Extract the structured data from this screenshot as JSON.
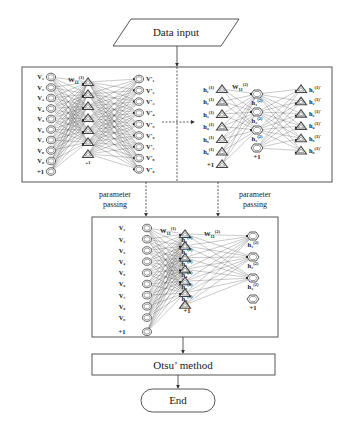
{
  "flowchart": {
    "start": {
      "label": "Data input",
      "shape": "parallelogram"
    },
    "pretrain_panel": {
      "rbm1": {
        "visible_labels": [
          "V₁",
          "V₂",
          "V₃",
          "V₄",
          "V₅",
          "V₆",
          "V₇",
          "V₈",
          "V₉",
          "+1"
        ],
        "weight_label": "W",
        "weight_sub": "11",
        "weight_sup": "(1)",
        "hidden_count": 7,
        "hidden_bias": "+1",
        "recon_labels": [
          "V'₁",
          "V'₂",
          "V'₃",
          "V'₄",
          "V'₅",
          "V'₆",
          "V'₇",
          "V'₈",
          "V'₉"
        ]
      },
      "rbm2": {
        "input_labels": [
          "h₁",
          "h₂",
          "h₃",
          "h₄",
          "h₅",
          "h₆",
          "+1"
        ],
        "input_sup": "(1)",
        "weight_label": "W",
        "weight_sub": "11",
        "weight_sup": "(2)",
        "hidden_labels": [
          "h₁",
          "h₂",
          "h₃",
          "+1"
        ],
        "hidden_sup": "(2)",
        "recon_labels": [
          "h₁",
          "h₂",
          "h₃",
          "h₄",
          "h₅",
          "h₆"
        ],
        "recon_sup": "(1)'"
      }
    },
    "parameter_passing": {
      "left_label_1": "parameter",
      "left_label_2": "passing",
      "right_label_1": "parameter",
      "right_label_2": "passing"
    },
    "finetune_panel": {
      "visible_labels": [
        "V₁",
        "V₂",
        "V₃",
        "V₄",
        "V₅",
        "V₆",
        "V₇",
        "V₈",
        "V₉",
        "+1"
      ],
      "w1_label": "W",
      "w1_sub": "11",
      "w1_sup": "(1)",
      "w2_label": "W",
      "w2_sub": "11",
      "w2_sup": "(2)",
      "hidden1_labels": [
        "h₁",
        "h₂",
        "h₃",
        "h₄",
        "h₅",
        "h₆",
        "+1"
      ],
      "hidden1_sup": "(1)",
      "hidden2_labels": [
        "h₁",
        "h₂",
        "h₃",
        "+1"
      ],
      "hidden2_sup": "(2)"
    },
    "process": {
      "label": "Otsu’ method"
    },
    "end": {
      "label": "End"
    }
  },
  "colors": {
    "stroke": "#444444",
    "text": "#1a1a1a",
    "background": "#ffffff"
  }
}
